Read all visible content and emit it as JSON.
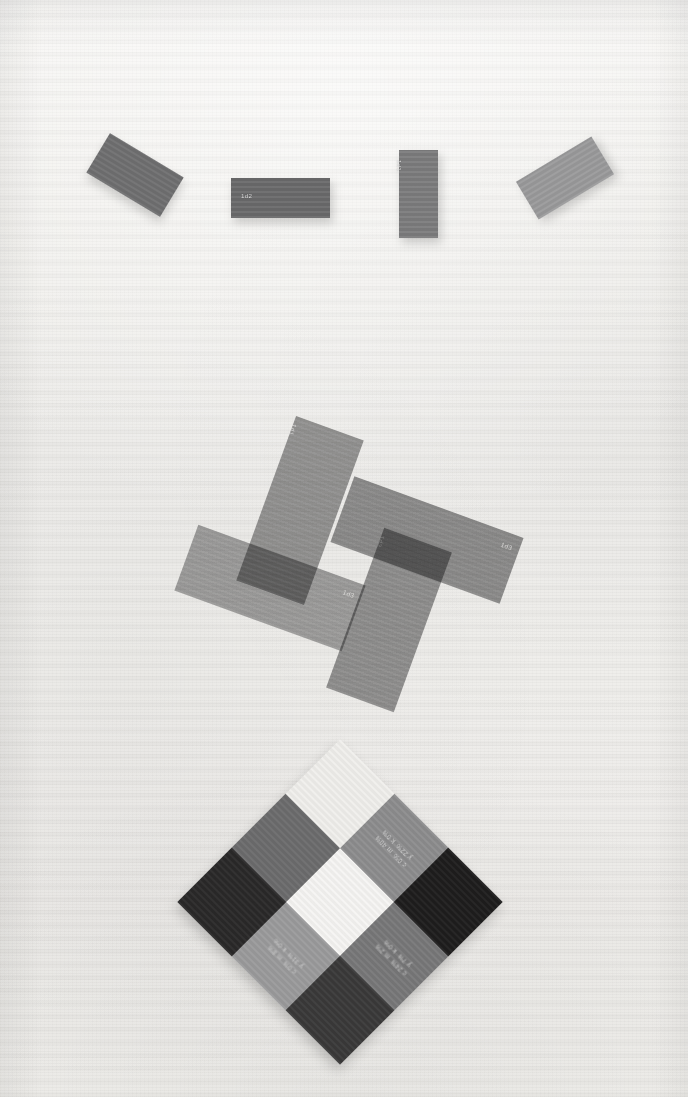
{
  "page": {
    "kind": "printed-color-test-chart-scan",
    "background_color": "#f1f0ed",
    "paper_tint": "#f6f5f3"
  },
  "top_row": {
    "name": "isolated-swatch-row",
    "swatches": [
      {
        "id": "swatch-1",
        "label": "",
        "color": "#6f6f70",
        "x": 92,
        "y": 152,
        "w": 86,
        "h": 46,
        "rotate": 31
      },
      {
        "id": "swatch-2",
        "label": "1d2",
        "color": "#6a6a6b",
        "x": 231,
        "y": 178,
        "w": 99,
        "h": 40,
        "rotate": 0
      },
      {
        "id": "swatch-3",
        "label": "1d1",
        "color": "#7c7c7d",
        "x": 399,
        "y": 150,
        "w": 39,
        "h": 88,
        "rotate": 0
      },
      {
        "id": "swatch-4",
        "label": "",
        "color": "#9a9a9b",
        "x": 521,
        "y": 156,
        "w": 88,
        "h": 44,
        "rotate": -31
      }
    ]
  },
  "pinwheel": {
    "name": "overlapping-swatch-pinwheel",
    "blend_mode": "multiply",
    "blades": [
      {
        "id": "blade-nw",
        "tag": "1d1",
        "color": "#8f8f90",
        "cx": 300,
        "cy": 510,
        "w": 72,
        "h": 175,
        "rotate": 20
      },
      {
        "id": "blade-ne",
        "tag": "1d3",
        "color": "#878788",
        "cx": 427,
        "cy": 540,
        "w": 180,
        "h": 70,
        "rotate": 20
      },
      {
        "id": "blade-se",
        "tag": "1d2",
        "color": "#8b8b8c",
        "cx": 389,
        "cy": 620,
        "w": 72,
        "h": 170,
        "rotate": 20
      },
      {
        "id": "blade-sw",
        "tag": "1d3",
        "color": "#9c9c9d",
        "cx": 270,
        "cy": 588,
        "w": 178,
        "h": 70,
        "rotate": 20
      }
    ]
  },
  "diamond": {
    "name": "cmyk-checkerboard-diamond",
    "rotation": 45,
    "cells": [
      {
        "id": "d-r1c1",
        "color": "#f0efec",
        "type": "blank",
        "c": "",
        "m": "",
        "y": "",
        "k": ""
      },
      {
        "id": "d-r1c2",
        "color": "#8d8d8e",
        "type": "swatch",
        "c": "c 0%",
        "m": "m 40%",
        "y": "y 22%",
        "k": "k 0%"
      },
      {
        "id": "d-r1c3",
        "color": "#1e1d1d",
        "type": "dark",
        "c": "",
        "m": "",
        "y": "",
        "k": ""
      },
      {
        "id": "d-r2c1",
        "color": "#6c6c6d",
        "type": "swatch",
        "c": "",
        "m": "",
        "y": "",
        "k": ""
      },
      {
        "id": "d-r2c2",
        "color": "#f6f5f3",
        "type": "blank",
        "c": "",
        "m": "",
        "y": "",
        "k": ""
      },
      {
        "id": "d-r2c3",
        "color": "#787879",
        "type": "swatch",
        "c": "c 24%",
        "m": "m 2%",
        "y": "y 7%",
        "k": "k 0%"
      },
      {
        "id": "d-r3c1",
        "color": "#2a2929",
        "type": "dark",
        "c": "",
        "m": "",
        "y": "",
        "k": ""
      },
      {
        "id": "d-r3c2",
        "color": "#9b9b9c",
        "type": "swatch",
        "c": "c 0%",
        "m": "m 8%",
        "y": "y 31%",
        "k": "k 0%"
      },
      {
        "id": "d-r3c3",
        "color": "#3a3939",
        "type": "dark",
        "c": "",
        "m": "",
        "y": "",
        "k": ""
      }
    ],
    "labels": [
      {
        "id": "lab-top-left",
        "c": "c 0%",
        "m": "m 40%",
        "y": "y 22%",
        "k": "k 0%"
      },
      {
        "id": "lab-top-right",
        "c": "c 24%",
        "m": "m 2%",
        "y": "y 7%",
        "k": "k 0%"
      },
      {
        "id": "lab-bottom-left",
        "c": "c 0%",
        "m": "m 8%",
        "y": "y 31%",
        "k": "k 0%"
      },
      {
        "id": "lab-bottom-right",
        "c": "c 25%",
        "m": "m 27%",
        "y": "y 6%",
        "k": "k 0%"
      }
    ]
  }
}
